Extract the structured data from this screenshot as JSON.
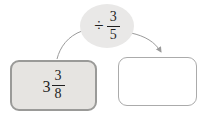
{
  "diagram": {
    "operation_bubble": {
      "operator": "÷",
      "fraction": {
        "numerator": "3",
        "denominator": "5"
      }
    },
    "dividend_box": {
      "whole": "3",
      "fraction": {
        "numerator": "3",
        "denominator": "8"
      }
    },
    "answer_box": {
      "value": ""
    }
  },
  "colors": {
    "ellipse_fill": "#e9e8e7",
    "filled_box_fill": "#e6e4e1",
    "filled_box_border": "#9a9a98",
    "empty_box_fill": "#ffffff",
    "empty_box_border": "#ababab",
    "connector": "#9b9b9b",
    "text": "#1f1f1f",
    "background": "#ffffff"
  }
}
